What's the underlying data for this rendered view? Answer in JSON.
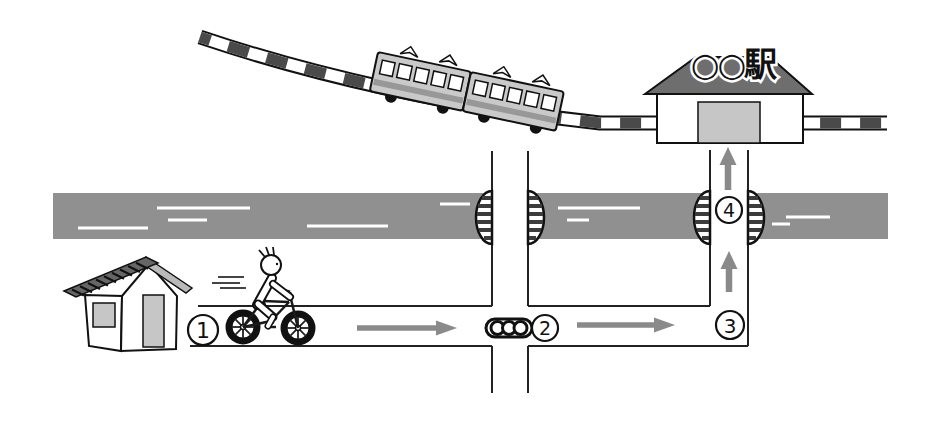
{
  "station": {
    "sign": "○○駅"
  },
  "waypoints": [
    {
      "label": "1"
    },
    {
      "label": "2"
    },
    {
      "label": "3"
    },
    {
      "label": "4"
    }
  ],
  "route": {
    "arrows": [
      {
        "name": "house-to-signal",
        "direction": "right"
      },
      {
        "name": "signal-to-corner",
        "direction": "right"
      },
      {
        "name": "corner-to-bridge",
        "direction": "up"
      },
      {
        "name": "bridge-to-station",
        "direction": "up"
      }
    ]
  },
  "icons": {
    "traffic_light": "three-lamp-signal",
    "bridge_railing": "striped-half-ellipse",
    "train": "two-car-commuter-train",
    "house": "house-with-striped-roof",
    "cyclist": "person-on-bicycle"
  },
  "colors": {
    "river": "#909090",
    "arrow": "#8a8a8a",
    "station_roof": "#6e6e6e",
    "train_body": "#c9c9c9",
    "track_tie": "#4a4a4a",
    "door_window_fill": "#c6c6c6",
    "outline": "#111111"
  }
}
